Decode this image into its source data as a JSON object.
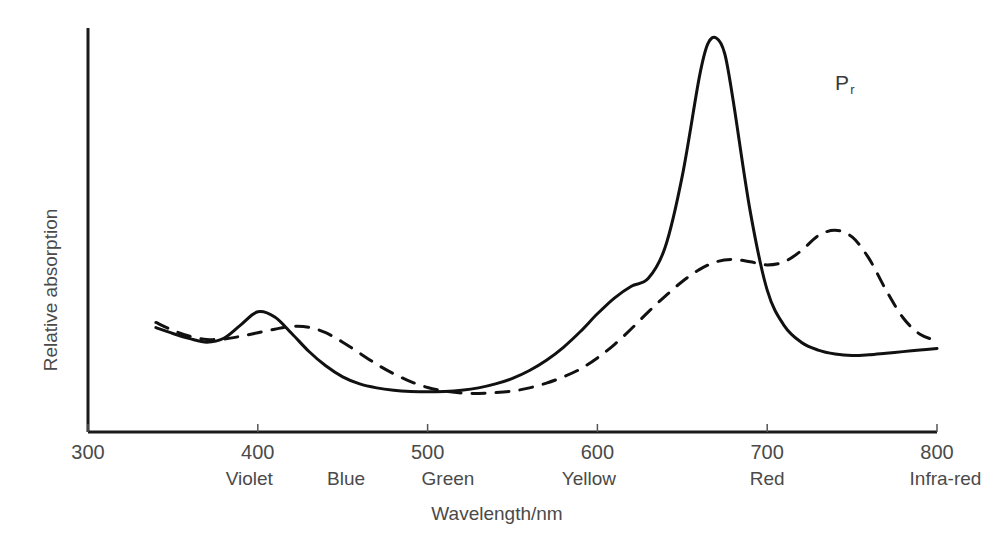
{
  "chart_data": {
    "type": "line",
    "title": "",
    "xlabel": "Wavelength/nm",
    "ylabel": "Relative absorption",
    "xlim": [
      300,
      800
    ],
    "ylim": [
      0,
      1
    ],
    "grid": false,
    "legend_position": "inline-annotations",
    "x_ticks": [
      300,
      400,
      500,
      600,
      700,
      800
    ],
    "x_tick_labels": [
      "300",
      "400",
      "500",
      "600",
      "700",
      "800"
    ],
    "y_ticks": [],
    "y_tick_labels": [],
    "spectral_bands": [
      {
        "label": "Violet",
        "center": 395
      },
      {
        "label": "Blue",
        "center": 452
      },
      {
        "label": "Green",
        "center": 512
      },
      {
        "label": "Yellow",
        "center": 595
      },
      {
        "label": "Red",
        "center": 700
      },
      {
        "label": "Infra-red",
        "center": 805
      }
    ],
    "series": [
      {
        "name": "Pr",
        "label": "P",
        "label_subscript": "r",
        "style": "solid",
        "color": "#111111",
        "label_x": 740,
        "label_y": 0.88,
        "x": [
          340,
          350,
          360,
          370,
          380,
          390,
          400,
          410,
          420,
          430,
          440,
          450,
          460,
          470,
          480,
          490,
          500,
          510,
          520,
          530,
          540,
          550,
          560,
          570,
          580,
          590,
          600,
          610,
          620,
          630,
          640,
          650,
          660,
          665,
          670,
          675,
          680,
          690,
          700,
          710,
          720,
          730,
          740,
          750,
          760,
          770,
          780,
          790,
          800
        ],
        "y": [
          0.265,
          0.25,
          0.237,
          0.228,
          0.238,
          0.272,
          0.305,
          0.292,
          0.25,
          0.205,
          0.168,
          0.14,
          0.122,
          0.112,
          0.106,
          0.103,
          0.102,
          0.103,
          0.106,
          0.112,
          0.122,
          0.136,
          0.156,
          0.182,
          0.215,
          0.255,
          0.3,
          0.34,
          0.37,
          0.39,
          0.47,
          0.65,
          0.9,
          0.985,
          1.0,
          0.96,
          0.84,
          0.56,
          0.36,
          0.27,
          0.228,
          0.208,
          0.198,
          0.194,
          0.196,
          0.2,
          0.204,
          0.208,
          0.212
        ]
      },
      {
        "name": "Pfr",
        "label": "P",
        "label_subscript": "fr",
        "style": "dashed",
        "color": "#111111",
        "label_x": 850,
        "label_y": 0.52,
        "x": [
          340,
          350,
          360,
          370,
          380,
          390,
          400,
          410,
          420,
          430,
          440,
          450,
          460,
          470,
          480,
          490,
          500,
          510,
          520,
          530,
          540,
          550,
          560,
          570,
          580,
          590,
          600,
          610,
          620,
          630,
          640,
          650,
          660,
          670,
          680,
          690,
          700,
          710,
          720,
          730,
          740,
          750,
          760,
          770,
          780,
          790,
          800
        ],
        "y": [
          0.278,
          0.258,
          0.243,
          0.235,
          0.236,
          0.243,
          0.252,
          0.261,
          0.268,
          0.266,
          0.252,
          0.228,
          0.2,
          0.172,
          0.148,
          0.128,
          0.113,
          0.104,
          0.099,
          0.098,
          0.1,
          0.104,
          0.112,
          0.124,
          0.14,
          0.16,
          0.188,
          0.222,
          0.262,
          0.305,
          0.345,
          0.382,
          0.412,
          0.432,
          0.438,
          0.432,
          0.424,
          0.432,
          0.46,
          0.498,
          0.512,
          0.495,
          0.44,
          0.36,
          0.29,
          0.248,
          0.232
        ]
      }
    ]
  },
  "axis": {
    "y_title": "Relative absorption",
    "x_title": "Wavelength/nm"
  }
}
